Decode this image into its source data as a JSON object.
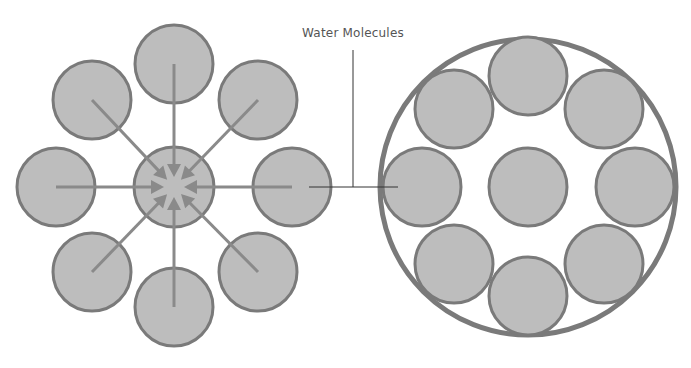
{
  "diagram": {
    "title_partial": "",
    "callout_label": "Water Molecules",
    "colors": {
      "molecule_fill": "#bdbdbd",
      "molecule_stroke": "#7a7a7a",
      "arrow": "#8a8a8a",
      "leader_line": "#333333",
      "label_text": "#555555"
    },
    "left_panel": {
      "description": "Water molecules surrounding a central molecule with arrows pointing inward",
      "center": {
        "x": 174,
        "y": 187,
        "r": 40
      },
      "outer_molecules": [
        {
          "x": 174,
          "y": 64
        },
        {
          "x": 258,
          "y": 100
        },
        {
          "x": 292,
          "y": 187
        },
        {
          "x": 258,
          "y": 272
        },
        {
          "x": 174,
          "y": 307
        },
        {
          "x": 92,
          "y": 272
        },
        {
          "x": 56,
          "y": 187
        },
        {
          "x": 92,
          "y": 100
        }
      ],
      "molecule_r": 39
    },
    "right_panel": {
      "description": "Enclosed cluster of molecules inside a boundary circle",
      "boundary": {
        "x": 528,
        "y": 187,
        "r": 148
      },
      "molecules": [
        {
          "x": 528,
          "y": 187
        },
        {
          "x": 528,
          "y": 76
        },
        {
          "x": 604,
          "y": 109
        },
        {
          "x": 635,
          "y": 187
        },
        {
          "x": 604,
          "y": 264
        },
        {
          "x": 528,
          "y": 296
        },
        {
          "x": 454,
          "y": 264
        },
        {
          "x": 422,
          "y": 187
        },
        {
          "x": 454,
          "y": 109
        }
      ],
      "molecule_r": 39
    }
  }
}
